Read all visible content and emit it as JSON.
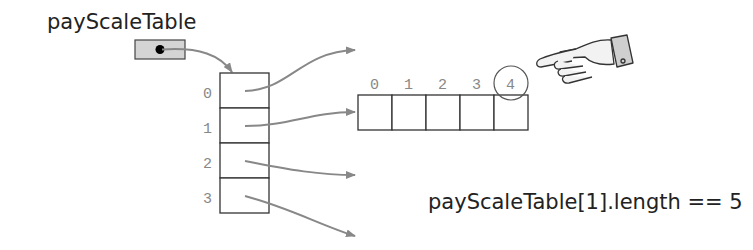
{
  "variable": {
    "name": "payScaleTable"
  },
  "outer_array": {
    "indices": [
      "0",
      "1",
      "2",
      "3"
    ]
  },
  "inner_array": {
    "indices": [
      "0",
      "1",
      "2",
      "3",
      "4"
    ],
    "highlighted_index": "4"
  },
  "annotation": {
    "expression": "payScaleTable[1].length == 5"
  },
  "icons": {
    "pointer": "pointing-hand-icon"
  },
  "colors": {
    "arrow": "#888888",
    "ref_box_fill": "#d4d4d4",
    "cell_stroke": "#333333"
  }
}
